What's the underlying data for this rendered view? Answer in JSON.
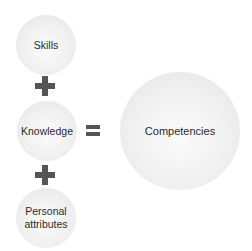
{
  "diagram": {
    "inputs": [
      {
        "label": "Skills"
      },
      {
        "label": "Knowledge"
      },
      {
        "label": "Personal attributes"
      }
    ],
    "operators": [
      "plus",
      "plus",
      "equals"
    ],
    "result": {
      "label": "Competencies"
    },
    "colors": {
      "circle_fill": "#f0f0f0",
      "symbol": "#555555",
      "text": "#2a2a2a"
    }
  }
}
